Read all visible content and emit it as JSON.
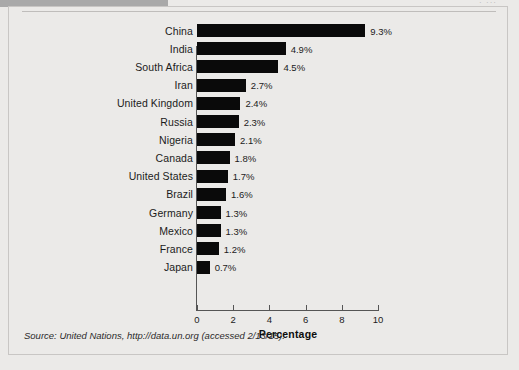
{
  "header": {
    "band_label": "",
    "corner_text": "· ···"
  },
  "axis": {
    "ticks": [
      "0",
      "2",
      "4",
      "6",
      "8",
      "10"
    ],
    "title": "Percentage"
  },
  "source": {
    "text": "Source: United Nations, http://data.un.org (accessed 2/13/15)."
  },
  "chart_data": {
    "type": "bar",
    "orientation": "horizontal",
    "title": "",
    "xlabel": "Percentage",
    "ylabel": "",
    "xlim": [
      0,
      10
    ],
    "xticks": [
      0,
      2,
      4,
      6,
      8,
      10
    ],
    "grid": false,
    "legend": null,
    "bar_color": "#0a0a0a",
    "background_color": "#ebeae8",
    "categories": [
      "China",
      "India",
      "South Africa",
      "Iran",
      "United Kingdom",
      "Russia",
      "Nigeria",
      "Canada",
      "United States",
      "Brazil",
      "Germany",
      "Mexico",
      "France",
      "Japan"
    ],
    "values": [
      9.3,
      4.9,
      4.5,
      2.7,
      2.4,
      2.3,
      2.1,
      1.8,
      1.7,
      1.6,
      1.3,
      1.3,
      1.2,
      0.7
    ],
    "data_labels": [
      "9.3%",
      "4.9%",
      "4.5%",
      "2.7%",
      "2.4%",
      "2.3%",
      "2.1%",
      "1.8%",
      "1.7%",
      "1.6%",
      "1.3%",
      "1.3%",
      "1.2%",
      "0.7%"
    ]
  }
}
